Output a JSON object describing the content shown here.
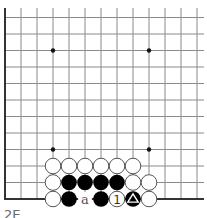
{
  "diagram": {
    "type": "go-board-partial",
    "columns_visible": 13,
    "rows_visible": 12,
    "edges": [
      "left",
      "bottom"
    ],
    "star_points": [
      [
        3,
        3
      ],
      [
        9,
        3
      ],
      [
        3,
        9
      ],
      [
        9,
        9
      ]
    ],
    "colors": {
      "line": "#8a8a8a",
      "edge": "#333333",
      "black": "#000000",
      "white": "#ffffff",
      "stone_outline": "#555555",
      "label": "#555555"
    },
    "stones": [
      {
        "col": 3,
        "row": 2,
        "color": "white"
      },
      {
        "col": 4,
        "row": 2,
        "color": "white"
      },
      {
        "col": 5,
        "row": 2,
        "color": "white"
      },
      {
        "col": 6,
        "row": 2,
        "color": "white"
      },
      {
        "col": 7,
        "row": 2,
        "color": "white"
      },
      {
        "col": 8,
        "row": 2,
        "color": "white"
      },
      {
        "col": 3,
        "row": 1,
        "color": "white"
      },
      {
        "col": 4,
        "row": 1,
        "color": "black"
      },
      {
        "col": 5,
        "row": 1,
        "color": "black"
      },
      {
        "col": 6,
        "row": 1,
        "color": "black"
      },
      {
        "col": 7,
        "row": 1,
        "color": "black"
      },
      {
        "col": 8,
        "row": 1,
        "color": "white"
      },
      {
        "col": 9,
        "row": 1,
        "color": "white"
      },
      {
        "col": 3,
        "row": 0,
        "color": "white"
      },
      {
        "col": 4,
        "row": 0,
        "color": "black"
      },
      {
        "col": 6,
        "row": 0,
        "color": "black"
      },
      {
        "col": 7,
        "row": 0,
        "color": "white",
        "label": "1"
      },
      {
        "col": 8,
        "row": 0,
        "color": "black",
        "marker": "triangle"
      },
      {
        "col": 9,
        "row": 0,
        "color": "white"
      }
    ],
    "point_labels": [
      {
        "col": 5,
        "row": 0,
        "label": "a"
      }
    ]
  },
  "caption": "2E"
}
